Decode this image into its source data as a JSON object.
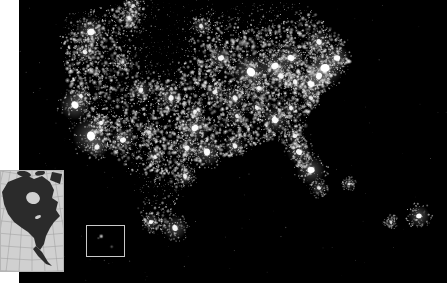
{
  "figure": {
    "kind": "satellite-night-lights-map",
    "region": "North America",
    "background_color": "#000000",
    "page_color": "#ffffff",
    "light_color": "#ffffff",
    "panel": {
      "x": 19,
      "y": 0,
      "width": 428,
      "height": 283
    }
  },
  "locator_inset": {
    "name": "north-america-locator-map",
    "x": 0,
    "y": 170,
    "width": 64,
    "height": 102,
    "land_color": "#2b2b2b",
    "ocean_color": "#d0d0d0",
    "graticule_color": "#9a9a9a",
    "border_color": "#b5b5b5",
    "graticule_visible": true
  },
  "callout_box": {
    "name": "hawaii-callout-box",
    "x": 86,
    "y": 225,
    "width": 39,
    "height": 32,
    "stroke_color": "#c9c9c9",
    "fill_color": "#000000",
    "stroke_width": 1.5,
    "contents": "two small island light clusters"
  },
  "chart_data": {
    "type": "scatter",
    "title": "",
    "subtitle": "",
    "xlabel": "",
    "ylabel": "",
    "xlim": [
      0,
      428
    ],
    "ylim": [
      0,
      283
    ],
    "grid": false,
    "legend": "none",
    "clusters": [
      {
        "name": "Seattle-Vancouver",
        "x": 72,
        "y": 32,
        "r": 4.5,
        "b": 0.95
      },
      {
        "name": "Portland",
        "x": 66,
        "y": 52,
        "r": 3.0,
        "b": 0.85
      },
      {
        "name": "Boise",
        "x": 104,
        "y": 62,
        "r": 2.0,
        "b": 0.7
      },
      {
        "name": "Salt-Lake-City",
        "x": 122,
        "y": 90,
        "r": 3.0,
        "b": 0.85
      },
      {
        "name": "Denver",
        "x": 152,
        "y": 98,
        "r": 3.4,
        "b": 0.9
      },
      {
        "name": "San-Francisco-Bay",
        "x": 56,
        "y": 105,
        "r": 4.5,
        "b": 1.0
      },
      {
        "name": "Sacramento",
        "x": 62,
        "y": 96,
        "r": 2.6,
        "b": 0.8
      },
      {
        "name": "Las-Vegas",
        "x": 82,
        "y": 123,
        "r": 2.6,
        "b": 0.88
      },
      {
        "name": "Los-Angeles",
        "x": 72,
        "y": 136,
        "r": 5.5,
        "b": 1.0
      },
      {
        "name": "San-Diego-Tijuana",
        "x": 78,
        "y": 147,
        "r": 3.2,
        "b": 0.9
      },
      {
        "name": "Phoenix",
        "x": 104,
        "y": 140,
        "r": 3.6,
        "b": 0.92
      },
      {
        "name": "Albuquerque",
        "x": 130,
        "y": 132,
        "r": 2.2,
        "b": 0.75
      },
      {
        "name": "El-Paso-Juarez",
        "x": 136,
        "y": 157,
        "r": 2.4,
        "b": 0.78
      },
      {
        "name": "Calgary",
        "x": 110,
        "y": 18,
        "r": 2.6,
        "b": 0.78
      },
      {
        "name": "Edmonton",
        "x": 114,
        "y": 6,
        "r": 2.4,
        "b": 0.75
      },
      {
        "name": "Winnipeg",
        "x": 182,
        "y": 26,
        "r": 2.6,
        "b": 0.78
      },
      {
        "name": "Minneapolis",
        "x": 202,
        "y": 58,
        "r": 3.6,
        "b": 0.92
      },
      {
        "name": "Omaha-Kansas-City",
        "x": 196,
        "y": 92,
        "r": 3.0,
        "b": 0.86
      },
      {
        "name": "Chicago",
        "x": 232,
        "y": 72,
        "r": 5.5,
        "b": 1.0
      },
      {
        "name": "Detroit",
        "x": 256,
        "y": 66,
        "r": 4.4,
        "b": 0.96
      },
      {
        "name": "Toronto",
        "x": 272,
        "y": 58,
        "r": 4.0,
        "b": 0.94
      },
      {
        "name": "Cleveland",
        "x": 262,
        "y": 76,
        "r": 3.4,
        "b": 0.9
      },
      {
        "name": "Pittsburgh",
        "x": 276,
        "y": 82,
        "r": 3.0,
        "b": 0.86
      },
      {
        "name": "St-Louis",
        "x": 216,
        "y": 98,
        "r": 3.2,
        "b": 0.88
      },
      {
        "name": "Indianapolis",
        "x": 240,
        "y": 88,
        "r": 2.6,
        "b": 0.82
      },
      {
        "name": "Montreal",
        "x": 300,
        "y": 42,
        "r": 3.4,
        "b": 0.9
      },
      {
        "name": "Boston",
        "x": 318,
        "y": 58,
        "r": 3.8,
        "b": 0.96
      },
      {
        "name": "New-York",
        "x": 306,
        "y": 68,
        "r": 5.5,
        "b": 1.0
      },
      {
        "name": "Philadelphia",
        "x": 300,
        "y": 76,
        "r": 4.0,
        "b": 0.96
      },
      {
        "name": "Washington-Baltimore",
        "x": 292,
        "y": 84,
        "r": 4.0,
        "b": 0.96
      },
      {
        "name": "Norfolk",
        "x": 292,
        "y": 98,
        "r": 2.6,
        "b": 0.82
      },
      {
        "name": "Charlotte",
        "x": 272,
        "y": 108,
        "r": 2.8,
        "b": 0.84
      },
      {
        "name": "Atlanta",
        "x": 256,
        "y": 120,
        "r": 4.0,
        "b": 0.95
      },
      {
        "name": "Nashville",
        "x": 238,
        "y": 108,
        "r": 2.6,
        "b": 0.82
      },
      {
        "name": "Memphis",
        "x": 218,
        "y": 116,
        "r": 2.6,
        "b": 0.82
      },
      {
        "name": "New-Orleans",
        "x": 216,
        "y": 146,
        "r": 3.0,
        "b": 0.88
      },
      {
        "name": "Houston",
        "x": 188,
        "y": 152,
        "r": 4.2,
        "b": 0.96
      },
      {
        "name": "Dallas-Fort-Worth",
        "x": 176,
        "y": 128,
        "r": 4.2,
        "b": 0.96
      },
      {
        "name": "San-Antonio-Austin",
        "x": 168,
        "y": 148,
        "r": 3.2,
        "b": 0.88
      },
      {
        "name": "Oklahoma-City",
        "x": 176,
        "y": 112,
        "r": 2.6,
        "b": 0.82
      },
      {
        "name": "Jacksonville",
        "x": 276,
        "y": 136,
        "r": 2.6,
        "b": 0.84
      },
      {
        "name": "Orlando-Tampa",
        "x": 280,
        "y": 152,
        "r": 3.6,
        "b": 0.94
      },
      {
        "name": "Miami-Southeast-FL",
        "x": 292,
        "y": 170,
        "r": 4.2,
        "b": 1.0
      },
      {
        "name": "Monterrey",
        "x": 166,
        "y": 176,
        "r": 2.8,
        "b": 0.84
      },
      {
        "name": "Mexico-City",
        "x": 156,
        "y": 228,
        "r": 3.6,
        "b": 0.92
      },
      {
        "name": "Guadalajara",
        "x": 132,
        "y": 222,
        "r": 2.6,
        "b": 0.82
      },
      {
        "name": "Havana-Cuba",
        "x": 300,
        "y": 188,
        "r": 2.4,
        "b": 0.8
      },
      {
        "name": "Bermuda-offshore",
        "x": 400,
        "y": 216,
        "r": 3.2,
        "b": 1.0
      },
      {
        "name": "Bahamas",
        "x": 330,
        "y": 184,
        "r": 1.8,
        "b": 0.7
      },
      {
        "name": "Puerto-Rico",
        "x": 372,
        "y": 222,
        "r": 1.8,
        "b": 0.72
      }
    ]
  }
}
